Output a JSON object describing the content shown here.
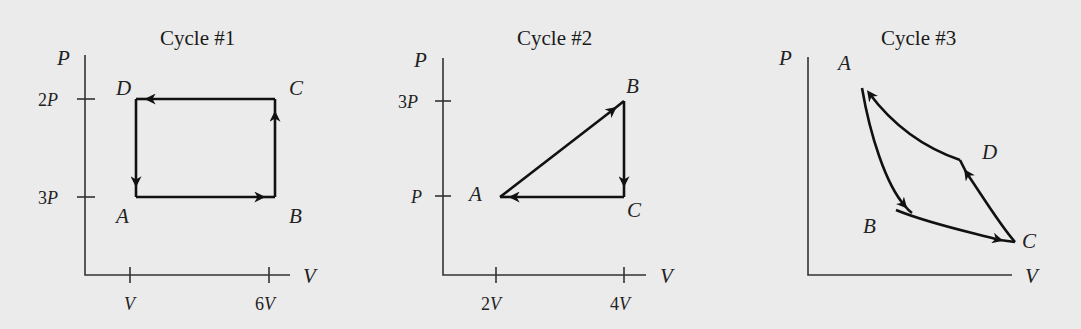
{
  "diagrams": [
    {
      "title": "Cycle #1",
      "axes": {
        "y_label": "P",
        "x_label": "V"
      },
      "y_ticks": [
        {
          "num": "2",
          "sym": "P"
        },
        {
          "num": "3",
          "sym": "P"
        }
      ],
      "x_ticks": [
        {
          "num": "",
          "sym": "V"
        },
        {
          "num": "6",
          "sym": "V"
        }
      ],
      "points": {
        "A": "A",
        "B": "B",
        "C": "C",
        "D": "D"
      },
      "path_order": [
        "A",
        "B",
        "C",
        "D",
        "A"
      ]
    },
    {
      "title": "Cycle #2",
      "axes": {
        "y_label": "P",
        "x_label": "V"
      },
      "y_ticks": [
        {
          "num": "3",
          "sym": "P"
        },
        {
          "num": "",
          "sym": "P"
        }
      ],
      "x_ticks": [
        {
          "num": "2",
          "sym": "V"
        },
        {
          "num": "4",
          "sym": "V"
        }
      ],
      "points": {
        "A": "A",
        "B": "B",
        "C": "C"
      },
      "path_order": [
        "A",
        "B",
        "C",
        "A"
      ]
    },
    {
      "title": "Cycle #3",
      "axes": {
        "y_label": "P",
        "x_label": "V"
      },
      "points": {
        "A": "A",
        "B": "B",
        "C": "C",
        "D": "D"
      },
      "path_order": [
        "A",
        "B",
        "C",
        "D",
        "A"
      ]
    }
  ]
}
